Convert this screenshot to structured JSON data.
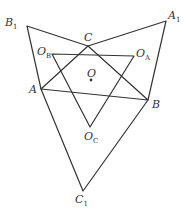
{
  "diagram": {
    "type": "geometry",
    "stroke_color": "#333333",
    "points": {
      "A": {
        "label": "A",
        "x": 41,
        "y": 89
      },
      "B": {
        "label": "B",
        "x": 148,
        "y": 100
      },
      "C": {
        "label": "C",
        "x": 88,
        "y": 46
      },
      "A1": {
        "label": "A",
        "sub": "1",
        "x": 166,
        "y": 21
      },
      "B1": {
        "label": "B",
        "sub": "1",
        "x": 27,
        "y": 26
      },
      "C1": {
        "label": "C",
        "sub": "1",
        "x": 83,
        "y": 191
      },
      "OA": {
        "label": "O",
        "sub": "A",
        "x": 134,
        "y": 56
      },
      "OB": {
        "label": "O",
        "sub": "B",
        "x": 52,
        "y": 54
      },
      "OC": {
        "label": "O",
        "sub": "C",
        "x": 90,
        "y": 127
      },
      "O": {
        "label": "O",
        "x": 91,
        "y": 80
      }
    },
    "segments": [
      [
        "B1",
        "C"
      ],
      [
        "C",
        "A1"
      ],
      [
        "A1",
        "B"
      ],
      [
        "B",
        "C1"
      ],
      [
        "C1",
        "A"
      ],
      [
        "A",
        "B1"
      ],
      [
        "A",
        "B"
      ],
      [
        "B",
        "C"
      ],
      [
        "C",
        "A"
      ],
      [
        "OA",
        "OB"
      ],
      [
        "OB",
        "OC"
      ],
      [
        "OC",
        "OA"
      ]
    ]
  }
}
